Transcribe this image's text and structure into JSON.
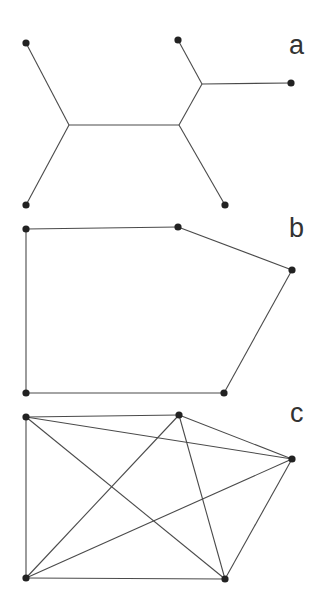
{
  "figure": {
    "colors": {
      "edge": "#4a4a4a",
      "node": "#222222",
      "label": "#333333",
      "background": "#ffffff"
    },
    "panels": [
      {
        "id": "a",
        "label": "a",
        "label_pos": [
          289,
          54
        ],
        "description": "Tree with 5 leaves and 3 internal junctions",
        "nodes": [
          [
            26,
            43
          ],
          [
            26,
            205
          ],
          [
            178,
            40
          ],
          [
            291,
            83
          ],
          [
            225,
            205
          ]
        ],
        "junctions": [
          [
            69,
            125
          ],
          [
            179,
            125
          ],
          [
            202,
            84
          ]
        ],
        "edges": [
          [
            [
              26,
              43
            ],
            [
              69,
              125
            ]
          ],
          [
            [
              26,
              205
            ],
            [
              69,
              125
            ]
          ],
          [
            [
              69,
              125
            ],
            [
              179,
              125
            ]
          ],
          [
            [
              179,
              125
            ],
            [
              202,
              84
            ]
          ],
          [
            [
              202,
              84
            ],
            [
              178,
              40
            ]
          ],
          [
            [
              202,
              84
            ],
            [
              291,
              83
            ]
          ],
          [
            [
              179,
              125
            ],
            [
              225,
              205
            ]
          ]
        ]
      },
      {
        "id": "b",
        "label": "b",
        "label_pos": [
          289,
          237
        ],
        "description": "Pentagon cycle on 5 nodes",
        "nodes": [
          [
            26,
            229
          ],
          [
            178,
            227
          ],
          [
            292,
            270
          ],
          [
            224,
            393
          ],
          [
            26,
            393
          ]
        ],
        "edges": [
          [
            [
              26,
              229
            ],
            [
              178,
              227
            ]
          ],
          [
            [
              178,
              227
            ],
            [
              292,
              270
            ]
          ],
          [
            [
              292,
              270
            ],
            [
              224,
              393
            ]
          ],
          [
            [
              224,
              393
            ],
            [
              26,
              393
            ]
          ],
          [
            [
              26,
              393
            ],
            [
              26,
              229
            ]
          ]
        ]
      },
      {
        "id": "c",
        "label": "c",
        "label_pos": [
          290,
          422
        ],
        "description": "Complete graph K5 on 5 nodes",
        "nodes": [
          [
            26,
            417
          ],
          [
            179,
            415
          ],
          [
            292,
            459
          ],
          [
            225,
            579
          ],
          [
            26,
            578
          ]
        ],
        "edges": [
          [
            [
              26,
              417
            ],
            [
              179,
              415
            ]
          ],
          [
            [
              26,
              417
            ],
            [
              292,
              459
            ]
          ],
          [
            [
              26,
              417
            ],
            [
              225,
              579
            ]
          ],
          [
            [
              26,
              417
            ],
            [
              26,
              578
            ]
          ],
          [
            [
              179,
              415
            ],
            [
              292,
              459
            ]
          ],
          [
            [
              179,
              415
            ],
            [
              225,
              579
            ]
          ],
          [
            [
              179,
              415
            ],
            [
              26,
              578
            ]
          ],
          [
            [
              292,
              459
            ],
            [
              225,
              579
            ]
          ],
          [
            [
              292,
              459
            ],
            [
              26,
              578
            ]
          ],
          [
            [
              225,
              579
            ],
            [
              26,
              578
            ]
          ]
        ]
      }
    ]
  }
}
